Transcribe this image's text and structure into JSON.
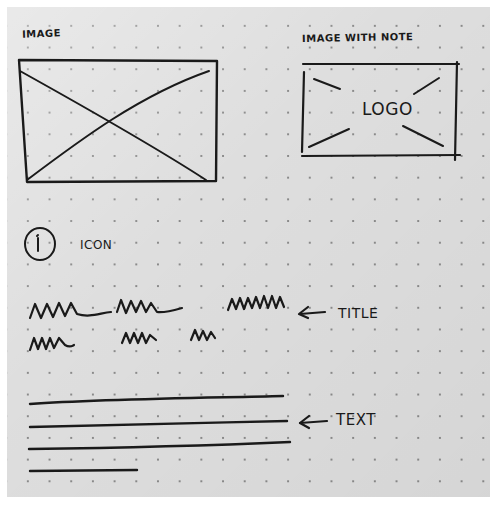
{
  "sketch": {
    "background": {
      "paper_color": "#dedede",
      "dot_color": "#8a8a8a",
      "ink_color": "#1a1a1a"
    },
    "image_placeholder": {
      "label": "IMAGE",
      "icon": "image-placeholder-x"
    },
    "image_with_note": {
      "label": "IMAGE WITH NOTE",
      "inner_text": "LOGO",
      "icon": "image-placeholder-x-broken"
    },
    "icon_component": {
      "glyph": "i",
      "icon": "info-circle-icon",
      "label": "ICON"
    },
    "title_component": {
      "lines": [
        "squiggle line 1",
        "squiggle line 2"
      ],
      "annotation": "TITLE",
      "arrow": "left-arrow"
    },
    "text_component": {
      "line_count": 4,
      "annotation": "TEXT",
      "arrow": "left-arrow"
    }
  }
}
